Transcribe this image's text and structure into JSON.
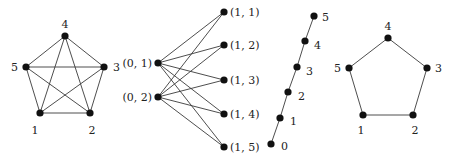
{
  "figure": {
    "colors": {
      "edge": "#3a3a3a",
      "node": "#111111",
      "label": "#222222",
      "background": "#ffffff"
    }
  },
  "graphs": [
    {
      "id": "complete-k5",
      "nodes": [
        {
          "label": "1",
          "x": 40,
          "y": 113,
          "lx": 35,
          "ly": 134,
          "anchor": "middle"
        },
        {
          "label": "2",
          "x": 90,
          "y": 113,
          "lx": 92,
          "ly": 134,
          "anchor": "middle"
        },
        {
          "label": "3",
          "x": 104,
          "y": 67,
          "lx": 113,
          "ly": 71,
          "anchor": "start"
        },
        {
          "label": "4",
          "x": 65,
          "y": 36,
          "lx": 65,
          "ly": 28,
          "anchor": "middle"
        },
        {
          "label": "5",
          "x": 26,
          "y": 67,
          "lx": 18,
          "ly": 71,
          "anchor": "end"
        }
      ],
      "edges": [
        [
          0,
          1
        ],
        [
          0,
          2
        ],
        [
          0,
          3
        ],
        [
          0,
          4
        ],
        [
          1,
          2
        ],
        [
          1,
          3
        ],
        [
          1,
          4
        ],
        [
          2,
          3
        ],
        [
          2,
          4
        ],
        [
          3,
          4
        ]
      ]
    },
    {
      "id": "bipartite-k25",
      "nodes": [
        {
          "label": "(0, 1)",
          "x": 158,
          "y": 63,
          "lx": 152,
          "ly": 67,
          "anchor": "end"
        },
        {
          "label": "(0, 2)",
          "x": 158,
          "y": 97,
          "lx": 152,
          "ly": 101,
          "anchor": "end"
        },
        {
          "label": "(1, 1)",
          "x": 224,
          "y": 12,
          "lx": 230,
          "ly": 16,
          "anchor": "start"
        },
        {
          "label": "(1, 2)",
          "x": 224,
          "y": 45,
          "lx": 230,
          "ly": 49,
          "anchor": "start"
        },
        {
          "label": "(1, 3)",
          "x": 224,
          "y": 80,
          "lx": 230,
          "ly": 84,
          "anchor": "start"
        },
        {
          "label": "(1, 4)",
          "x": 224,
          "y": 114,
          "lx": 230,
          "ly": 118,
          "anchor": "start"
        },
        {
          "label": "(1, 5)",
          "x": 224,
          "y": 147,
          "lx": 230,
          "ly": 151,
          "anchor": "start"
        }
      ],
      "edges": [
        [
          0,
          2
        ],
        [
          0,
          3
        ],
        [
          0,
          4
        ],
        [
          0,
          5
        ],
        [
          0,
          6
        ],
        [
          1,
          2
        ],
        [
          1,
          3
        ],
        [
          1,
          4
        ],
        [
          1,
          5
        ],
        [
          1,
          6
        ]
      ]
    },
    {
      "id": "path-p6",
      "nodes": [
        {
          "label": "0",
          "x": 271,
          "y": 144,
          "lx": 281,
          "ly": 150,
          "anchor": "start"
        },
        {
          "label": "1",
          "x": 280,
          "y": 118,
          "lx": 290,
          "ly": 125,
          "anchor": "start"
        },
        {
          "label": "2",
          "x": 288,
          "y": 92,
          "lx": 298,
          "ly": 100,
          "anchor": "start"
        },
        {
          "label": "3",
          "x": 297,
          "y": 67,
          "lx": 306,
          "ly": 75,
          "anchor": "start"
        },
        {
          "label": "4",
          "x": 305,
          "y": 41,
          "lx": 314,
          "ly": 49,
          "anchor": "start"
        },
        {
          "label": "5",
          "x": 314,
          "y": 16,
          "lx": 322,
          "ly": 21,
          "anchor": "start"
        }
      ],
      "edges": [
        [
          0,
          1
        ],
        [
          1,
          2
        ],
        [
          2,
          3
        ],
        [
          3,
          4
        ],
        [
          4,
          5
        ]
      ]
    },
    {
      "id": "cycle-c5",
      "nodes": [
        {
          "label": "1",
          "x": 363,
          "y": 115,
          "lx": 361,
          "ly": 134,
          "anchor": "middle"
        },
        {
          "label": "2",
          "x": 413,
          "y": 115,
          "lx": 415,
          "ly": 134,
          "anchor": "middle"
        },
        {
          "label": "3",
          "x": 427,
          "y": 68,
          "lx": 435,
          "ly": 72,
          "anchor": "start"
        },
        {
          "label": "4",
          "x": 388,
          "y": 38,
          "lx": 388,
          "ly": 30,
          "anchor": "middle"
        },
        {
          "label": "5",
          "x": 349,
          "y": 68,
          "lx": 341,
          "ly": 72,
          "anchor": "end"
        }
      ],
      "edges": [
        [
          0,
          1
        ],
        [
          1,
          2
        ],
        [
          2,
          3
        ],
        [
          3,
          4
        ],
        [
          4,
          0
        ]
      ]
    }
  ]
}
